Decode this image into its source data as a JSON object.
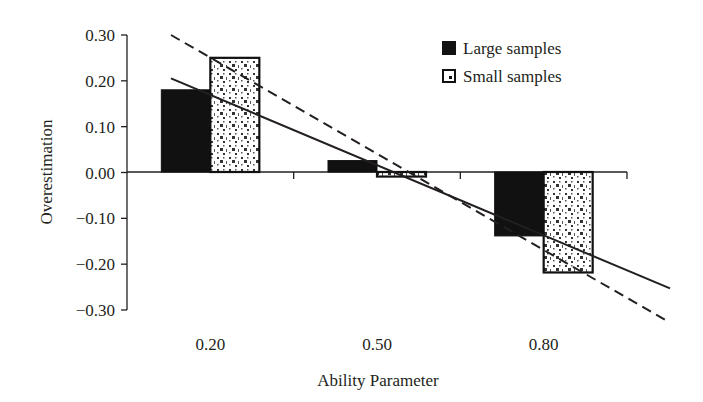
{
  "chart_data": {
    "type": "bar",
    "title": "",
    "xlabel": "Ability Parameter",
    "ylabel": "Overestimation",
    "categories": [
      "0.20",
      "0.50",
      "0.80"
    ],
    "series": [
      {
        "name": "Large samples",
        "values": [
          0.18,
          0.025,
          -0.14
        ],
        "fill": "solid-black"
      },
      {
        "name": "Small samples",
        "values": [
          0.25,
          -0.01,
          -0.22
        ],
        "fill": "dotted-pattern"
      }
    ],
    "trend_lines": [
      {
        "series": "Large samples",
        "style": "solid",
        "approx_start": [
          0.12,
          0.205
        ],
        "approx_end": [
          0.97,
          -0.255
        ]
      },
      {
        "series": "Small samples",
        "style": "dashed",
        "approx_start": [
          0.12,
          0.3
        ],
        "approx_end": [
          0.97,
          -0.33
        ]
      }
    ],
    "ylim": [
      -0.3,
      0.3
    ],
    "yticks": [
      "0.30",
      "0.20",
      "0.10",
      "0.00",
      "−0.10",
      "−0.20",
      "−0.30"
    ],
    "grid": false,
    "legend_position": "top-right"
  },
  "legend": {
    "items": [
      {
        "label": "Large samples"
      },
      {
        "label": "Small samples"
      }
    ]
  },
  "axes": {
    "x_title": "Ability Parameter",
    "y_title": "Overestimation"
  }
}
